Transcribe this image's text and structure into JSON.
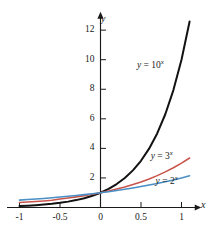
{
  "chart_data": {
    "type": "line",
    "title": "",
    "subtitle": "",
    "xlabel": "x",
    "ylabel": "y",
    "xlim": [
      -1.08,
      1.12
    ],
    "ylim": [
      -0.35,
      12.9
    ],
    "grid": false,
    "legend_position": "inline-annotations",
    "x_ticks": [
      -1,
      -0.5,
      0,
      0.5,
      1
    ],
    "x_tick_labels": [
      "-1",
      "-0.5",
      "0",
      "0.5",
      "1"
    ],
    "y_ticks": [
      2,
      4,
      6,
      8,
      10,
      12
    ],
    "y_tick_labels": [
      "2",
      "4",
      "6",
      "8",
      "10",
      "12"
    ],
    "series": [
      {
        "name": "y = 10^x",
        "base": 10,
        "color": "#121212",
        "x": [
          -1,
          -0.9,
          -0.8,
          -0.7,
          -0.6,
          -0.5,
          -0.4,
          -0.3,
          -0.2,
          -0.1,
          0,
          0.1,
          0.2,
          0.3,
          0.4,
          0.5,
          0.6,
          0.7,
          0.8,
          0.9,
          1,
          1.1
        ],
        "values": [
          0.1,
          0.126,
          0.158,
          0.2,
          0.251,
          0.316,
          0.398,
          0.501,
          0.631,
          0.794,
          1,
          1.259,
          1.585,
          1.995,
          2.512,
          3.162,
          3.981,
          5.012,
          6.31,
          7.943,
          10,
          12.589
        ]
      },
      {
        "name": "y = 3^x",
        "base": 3,
        "color": "#c8544b",
        "x": [
          -1,
          -0.9,
          -0.8,
          -0.7,
          -0.6,
          -0.5,
          -0.4,
          -0.3,
          -0.2,
          -0.1,
          0,
          0.1,
          0.2,
          0.3,
          0.4,
          0.5,
          0.6,
          0.7,
          0.8,
          0.9,
          1,
          1.1
        ],
        "values": [
          0.333,
          0.367,
          0.404,
          0.445,
          0.49,
          0.577,
          0.644,
          0.719,
          0.803,
          0.896,
          1,
          1.116,
          1.246,
          1.39,
          1.552,
          1.732,
          1.933,
          2.158,
          2.408,
          2.688,
          3,
          3.348
        ]
      },
      {
        "name": "y = 2^x",
        "base": 2,
        "color": "#4a8fc4",
        "x": [
          -1,
          -0.9,
          -0.8,
          -0.7,
          -0.6,
          -0.5,
          -0.4,
          -0.3,
          -0.2,
          -0.1,
          0,
          0.1,
          0.2,
          0.3,
          0.4,
          0.5,
          0.6,
          0.7,
          0.8,
          0.9,
          1,
          1.1
        ],
        "values": [
          0.5,
          0.536,
          0.574,
          0.616,
          0.66,
          0.707,
          0.758,
          0.812,
          0.871,
          0.933,
          1,
          1.072,
          1.149,
          1.231,
          1.32,
          1.414,
          1.516,
          1.625,
          1.741,
          1.866,
          2,
          2.144
        ]
      }
    ],
    "annotations": [
      {
        "id": "label-10",
        "text_y": "y",
        "text_eq": " = 10",
        "text_sup": "x",
        "x": 0.45,
        "y": 9.6
      },
      {
        "id": "label-3",
        "text_y": "y",
        "text_eq": " = 3",
        "text_sup": "x",
        "x": 0.62,
        "y": 3.4
      },
      {
        "id": "label-2",
        "text_y": "y",
        "text_eq": " = 2",
        "text_sup": "x",
        "x": 0.68,
        "y": 1.72
      }
    ]
  },
  "axes": {
    "y_name": "y",
    "x_name": "x"
  }
}
